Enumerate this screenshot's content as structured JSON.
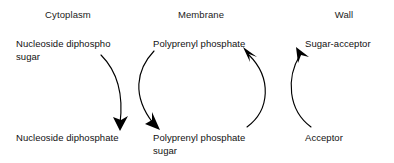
{
  "diagram": {
    "background_color": "#ffffff",
    "stroke_color": "#000000",
    "text_color": "#111111",
    "width": 394,
    "height": 163,
    "compartments": [
      {
        "id": "cytoplasm",
        "label": "Cytoplasm",
        "center_x": 68,
        "y": 9
      },
      {
        "id": "membrane",
        "label": "Membrane",
        "center_x": 201,
        "y": 9
      },
      {
        "id": "wall",
        "label": "Wall",
        "center_x": 344,
        "y": 9
      }
    ],
    "species": [
      {
        "id": "nucleoside-diphospho-sugar",
        "label": "Nucleoside diphospho\nsugar",
        "compartment": "cytoplasm",
        "row": "top",
        "x": 16,
        "y": 38
      },
      {
        "id": "polyprenyl-phosphate",
        "label": "Polyprenyl phosphate",
        "compartment": "membrane",
        "row": "top",
        "x": 153,
        "y": 38
      },
      {
        "id": "sugar-acceptor",
        "label": "Sugar-acceptor",
        "compartment": "wall",
        "row": "top",
        "x": 305,
        "y": 38
      },
      {
        "id": "nucleoside-diphosphate",
        "label": "Nucleoside diphosphate",
        "compartment": "cytoplasm",
        "row": "bottom",
        "x": 16,
        "y": 132
      },
      {
        "id": "polyprenyl-phosphate-sugar",
        "label": "Polyprenyl phosphate\nsugar",
        "compartment": "membrane",
        "row": "bottom",
        "x": 153,
        "y": 132
      },
      {
        "id": "acceptor",
        "label": "Acceptor",
        "compartment": "wall",
        "row": "bottom",
        "x": 305,
        "y": 132
      }
    ],
    "arrows": [
      {
        "id": "arrow-nds-to-ndp",
        "from": "nucleoside-diphospho-sugar",
        "to": "nucleoside-diphosphate",
        "direction": "down",
        "path": "M 101,55 C 116,70 124,92 120,124"
      },
      {
        "id": "arrow-pp-to-pps",
        "from": "polyprenyl-phosphate",
        "to": "polyprenyl-phosphate-sugar",
        "direction": "down",
        "path": "M 154,51 C 136,70 132,96 153,123"
      },
      {
        "id": "arrow-pps-to-pp",
        "from": "polyprenyl-phosphate-sugar",
        "to": "polyprenyl-phosphate",
        "direction": "up",
        "path": "M 247,127 C 270,110 272,78 249,55"
      },
      {
        "id": "arrow-acceptor-to-sugar-acceptor",
        "from": "acceptor",
        "to": "sugar-acceptor",
        "direction": "up",
        "path": "M 311,127 C 288,110 286,78 300,55"
      }
    ]
  }
}
